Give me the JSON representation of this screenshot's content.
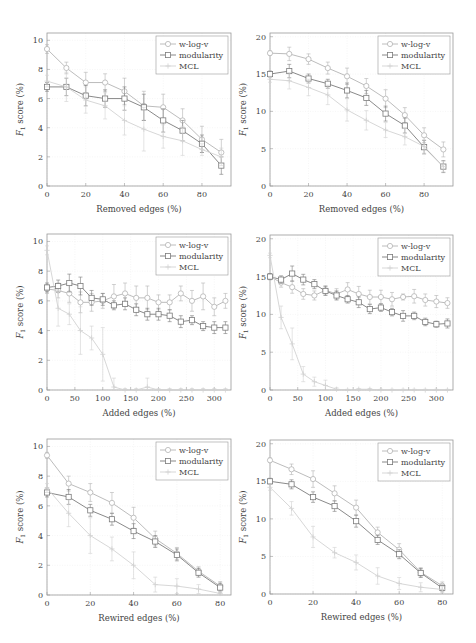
{
  "figure": {
    "series_styles": {
      "w-log-v": {
        "color": "#b4b4b4",
        "marker": "circle"
      },
      "modularity": {
        "color": "#7c7c7c",
        "marker": "square"
      },
      "MCL": {
        "color": "#d2d2d2",
        "marker": "plus"
      }
    },
    "axis_color": "#9a9a9a",
    "grid_color": "#ececec"
  },
  "chart_data": [
    {
      "id": "removed-left",
      "type": "line",
      "panel": {
        "x": 47,
        "y": 33,
        "w": 184,
        "h": 153
      },
      "xlabel": "Removed edges (%)",
      "ylabel": "F1 score (%)",
      "xlim": [
        0,
        95
      ],
      "ylim": [
        0,
        10.5
      ],
      "xticks": [
        0,
        20,
        40,
        60,
        80
      ],
      "yticks": [
        0,
        2,
        4,
        6,
        8,
        10
      ],
      "legend": {
        "position": "top-right",
        "entries": [
          "w-log-v",
          "modularity",
          "MCL"
        ]
      },
      "grid": true,
      "x": [
        0,
        10,
        20,
        30,
        40,
        50,
        60,
        70,
        80,
        90
      ],
      "series": [
        {
          "name": "w-log-v",
          "values": [
            9.4,
            8.1,
            7.1,
            7.1,
            6.5,
            5.5,
            5.4,
            4.5,
            3.2,
            2.3
          ],
          "err": [
            0.3,
            0.4,
            0.7,
            0.6,
            0.9,
            1.0,
            0.9,
            0.8,
            0.9,
            0.9
          ]
        },
        {
          "name": "modularity",
          "values": [
            6.8,
            6.8,
            6.2,
            6.0,
            6.0,
            5.4,
            4.5,
            3.8,
            2.9,
            1.4
          ],
          "err": [
            0.3,
            0.6,
            0.7,
            0.6,
            0.8,
            0.9,
            0.8,
            0.7,
            0.6,
            0.6
          ]
        },
        {
          "name": "MCL",
          "values": [
            7.2,
            6.8,
            5.9,
            5.5,
            4.5,
            3.9,
            3.4,
            3.1,
            2.5,
            2.0
          ],
          "err": [
            0.4,
            1.0,
            0.9,
            0.9,
            1.0,
            1.5,
            0.8,
            1.0,
            0.4,
            0.6
          ]
        }
      ]
    },
    {
      "id": "removed-right",
      "type": "line",
      "panel": {
        "x": 270,
        "y": 33,
        "w": 183,
        "h": 153
      },
      "xlabel": "Removed edges (%)",
      "ylabel": "F1 score (%)",
      "xlim": [
        0,
        95
      ],
      "ylim": [
        0,
        20.5
      ],
      "xticks": [
        0,
        20,
        40,
        60,
        80
      ],
      "yticks": [
        0,
        5,
        10,
        15,
        20
      ],
      "legend": {
        "position": "top-right",
        "entries": [
          "w-log-v",
          "modularity",
          "MCL"
        ]
      },
      "grid": true,
      "x": [
        0,
        10,
        20,
        30,
        40,
        50,
        60,
        70,
        80,
        90
      ],
      "series": [
        {
          "name": "w-log-v",
          "values": [
            17.8,
            17.7,
            17.0,
            15.8,
            14.7,
            13.4,
            11.7,
            9.5,
            6.8,
            4.9
          ],
          "err": [
            0.3,
            0.9,
            0.7,
            0.8,
            1.1,
            1.0,
            1.2,
            1.0,
            1.0,
            1.0
          ]
        },
        {
          "name": "modularity",
          "values": [
            15.0,
            15.4,
            14.4,
            13.7,
            12.8,
            11.8,
            9.7,
            8.1,
            5.2,
            2.6
          ],
          "err": [
            0.4,
            0.9,
            0.6,
            0.6,
            1.0,
            1.0,
            1.0,
            1.0,
            0.9,
            0.8
          ]
        },
        {
          "name": "MCL",
          "values": [
            14.3,
            14.1,
            13.2,
            12.2,
            10.2,
            8.8,
            7.5,
            6.6,
            5.3,
            2.6
          ],
          "err": [
            0.4,
            1.1,
            1.1,
            1.3,
            1.5,
            1.3,
            1.0,
            1.1,
            0.9,
            0.7
          ]
        }
      ]
    },
    {
      "id": "added-left",
      "type": "line",
      "panel": {
        "x": 47,
        "y": 234,
        "w": 184,
        "h": 156
      },
      "xlabel": "Added edges (%)",
      "ylabel": "F1 score (%)",
      "xlim": [
        0,
        330
      ],
      "ylim": [
        0,
        10.5
      ],
      "xticks": [
        0,
        50,
        100,
        150,
        200,
        250,
        300
      ],
      "yticks": [
        0,
        2,
        4,
        6,
        8,
        10
      ],
      "legend": {
        "position": "top-right",
        "entries": [
          "w-log-v",
          "modularity",
          "MCL"
        ]
      },
      "grid": true,
      "x": [
        0,
        20,
        40,
        60,
        80,
        100,
        120,
        140,
        160,
        180,
        200,
        220,
        240,
        260,
        280,
        300,
        320
      ],
      "series": [
        {
          "name": "w-log-v",
          "values": [
            6.8,
            6.7,
            6.5,
            5.9,
            5.9,
            6.0,
            6.3,
            6.5,
            6.2,
            6.2,
            5.9,
            5.9,
            6.5,
            6.0,
            6.3,
            5.6,
            6.0
          ],
          "err": [
            0.3,
            0.5,
            0.6,
            0.7,
            0.6,
            0.5,
            0.8,
            0.7,
            0.8,
            0.8,
            0.5,
            0.5,
            0.5,
            0.7,
            0.9,
            0.6,
            0.5
          ]
        },
        {
          "name": "modularity",
          "values": [
            6.9,
            7.0,
            7.2,
            7.0,
            6.2,
            6.1,
            5.7,
            5.8,
            5.4,
            5.1,
            5.1,
            5.0,
            4.6,
            4.7,
            4.3,
            4.2,
            4.2
          ],
          "err": [
            0.3,
            0.4,
            0.6,
            0.6,
            0.5,
            0.4,
            0.3,
            0.4,
            0.4,
            0.4,
            0.4,
            0.4,
            0.4,
            0.3,
            0.3,
            0.4,
            0.4
          ]
        },
        {
          "name": "MCL",
          "values": [
            9.4,
            5.5,
            5.1,
            4.0,
            3.5,
            2.4,
            0.2,
            0.0,
            0.0,
            0.2,
            0.0,
            0.0,
            0.0,
            0.0,
            0.0,
            0.0,
            0.0
          ],
          "err": [
            0.3,
            1.2,
            0.7,
            1.6,
            0.8,
            1.8,
            0.6,
            0.1,
            0.1,
            0.6,
            0.1,
            0.1,
            0.1,
            0.1,
            0.1,
            0.1,
            0.1
          ]
        }
      ]
    },
    {
      "id": "added-right",
      "type": "line",
      "panel": {
        "x": 270,
        "y": 235,
        "w": 183,
        "h": 155
      },
      "xlabel": "Added edges (%)",
      "ylabel": "F1 score (%)",
      "xlim": [
        0,
        330
      ],
      "ylim": [
        0,
        20.5
      ],
      "xticks": [
        0,
        50,
        100,
        150,
        200,
        250,
        300
      ],
      "yticks": [
        0,
        5,
        10,
        15,
        20
      ],
      "legend": {
        "position": "top-right",
        "entries": [
          "w-log-v",
          "modularity",
          "MCL"
        ]
      },
      "grid": true,
      "x": [
        0,
        20,
        40,
        60,
        80,
        100,
        120,
        140,
        160,
        180,
        200,
        220,
        240,
        260,
        280,
        300,
        320
      ],
      "series": [
        {
          "name": "w-log-v",
          "values": [
            15.0,
            14.2,
            13.6,
            12.7,
            12.5,
            13.2,
            12.7,
            13.3,
            12.7,
            12.3,
            12.3,
            12.0,
            12.3,
            12.4,
            11.9,
            11.7,
            11.5
          ],
          "err": [
            0.4,
            0.6,
            0.8,
            0.7,
            0.6,
            0.6,
            0.7,
            0.9,
            1.0,
            0.9,
            0.9,
            0.9,
            0.4,
            0.9,
            0.8,
            0.8,
            0.7
          ]
        },
        {
          "name": "modularity",
          "values": [
            15.0,
            14.6,
            15.4,
            14.6,
            14.0,
            13.1,
            12.5,
            12.0,
            11.6,
            10.7,
            10.9,
            10.3,
            9.8,
            9.8,
            9.0,
            8.7,
            8.8
          ],
          "err": [
            0.4,
            0.5,
            1.0,
            0.7,
            0.6,
            0.6,
            0.6,
            0.5,
            0.7,
            0.6,
            0.5,
            0.5,
            0.7,
            0.5,
            0.5,
            0.4,
            0.6
          ]
        },
        {
          "name": "MCL",
          "values": [
            17.8,
            9.6,
            6.1,
            2.1,
            1.1,
            0.6,
            0.1,
            0.0,
            0.1,
            0.1,
            0.0,
            0.0,
            0.0,
            0.0,
            0.0,
            0.0,
            0.0
          ],
          "err": [
            0.3,
            1.5,
            2.1,
            1.0,
            0.6,
            0.7,
            0.2,
            0.1,
            0.1,
            0.1,
            0.1,
            0.1,
            0.1,
            0.1,
            0.1,
            0.1,
            0.1
          ]
        }
      ]
    },
    {
      "id": "rewired-left",
      "type": "line",
      "panel": {
        "x": 47,
        "y": 439,
        "w": 184,
        "h": 156
      },
      "xlabel": "Rewired edges (%)",
      "ylabel": "F1 score (%)",
      "xlim": [
        0,
        85
      ],
      "ylim": [
        0,
        10.5
      ],
      "xticks": [
        0,
        20,
        40,
        60,
        80
      ],
      "yticks": [
        0,
        2,
        4,
        6,
        8,
        10
      ],
      "legend": {
        "position": "top-right",
        "entries": [
          "w-log-v",
          "modularity",
          "MCL"
        ]
      },
      "grid": true,
      "x": [
        0,
        10,
        20,
        30,
        40,
        50,
        60,
        70,
        80
      ],
      "series": [
        {
          "name": "w-log-v",
          "values": [
            9.4,
            7.5,
            6.9,
            6.2,
            5.2,
            3.8,
            2.8,
            1.6,
            0.6
          ],
          "err": [
            0.2,
            0.5,
            0.6,
            0.7,
            0.7,
            0.5,
            0.4,
            0.3,
            0.3
          ]
        },
        {
          "name": "modularity",
          "values": [
            6.9,
            6.6,
            5.7,
            5.1,
            4.3,
            3.6,
            2.7,
            1.5,
            0.5
          ],
          "err": [
            0.3,
            0.5,
            0.4,
            0.4,
            0.5,
            0.4,
            0.4,
            0.3,
            0.3
          ]
        },
        {
          "name": "MCL",
          "values": [
            7.2,
            5.5,
            4.0,
            3.1,
            2.0,
            0.7,
            0.6,
            0.4,
            0.1
          ],
          "err": [
            0.3,
            0.9,
            1.2,
            0.8,
            0.9,
            0.5,
            0.5,
            0.3,
            0.1
          ]
        }
      ]
    },
    {
      "id": "rewired-right",
      "type": "line",
      "panel": {
        "x": 270,
        "y": 440,
        "w": 183,
        "h": 154
      },
      "xlabel": "Rewired edges (%)",
      "ylabel": "F1 score (%)",
      "xlim": [
        0,
        85
      ],
      "ylim": [
        0,
        20.5
      ],
      "xticks": [
        0,
        20,
        40,
        60,
        80
      ],
      "yticks": [
        0,
        5,
        10,
        15,
        20
      ],
      "legend": {
        "position": "top-right",
        "entries": [
          "w-log-v",
          "modularity",
          "MCL"
        ]
      },
      "grid": true,
      "x": [
        0,
        10,
        20,
        30,
        40,
        50,
        60,
        70,
        80
      ],
      "series": [
        {
          "name": "w-log-v",
          "values": [
            17.8,
            16.6,
            15.3,
            13.4,
            11.5,
            8.2,
            5.9,
            2.9,
            1.1
          ],
          "err": [
            0.3,
            0.7,
            1.1,
            1.0,
            1.0,
            0.7,
            0.8,
            0.6,
            0.5
          ]
        },
        {
          "name": "modularity",
          "values": [
            15.0,
            14.6,
            12.9,
            11.7,
            9.7,
            7.2,
            5.3,
            2.8,
            0.8
          ],
          "err": [
            0.4,
            0.6,
            0.7,
            0.7,
            0.8,
            0.6,
            0.6,
            0.6,
            0.4
          ]
        },
        {
          "name": "MCL",
          "values": [
            14.2,
            11.4,
            7.6,
            5.5,
            4.2,
            2.4,
            1.4,
            0.9,
            0.6
          ],
          "err": [
            0.4,
            0.9,
            1.4,
            0.7,
            1.0,
            1.1,
            0.8,
            0.6,
            0.4
          ]
        }
      ]
    }
  ]
}
